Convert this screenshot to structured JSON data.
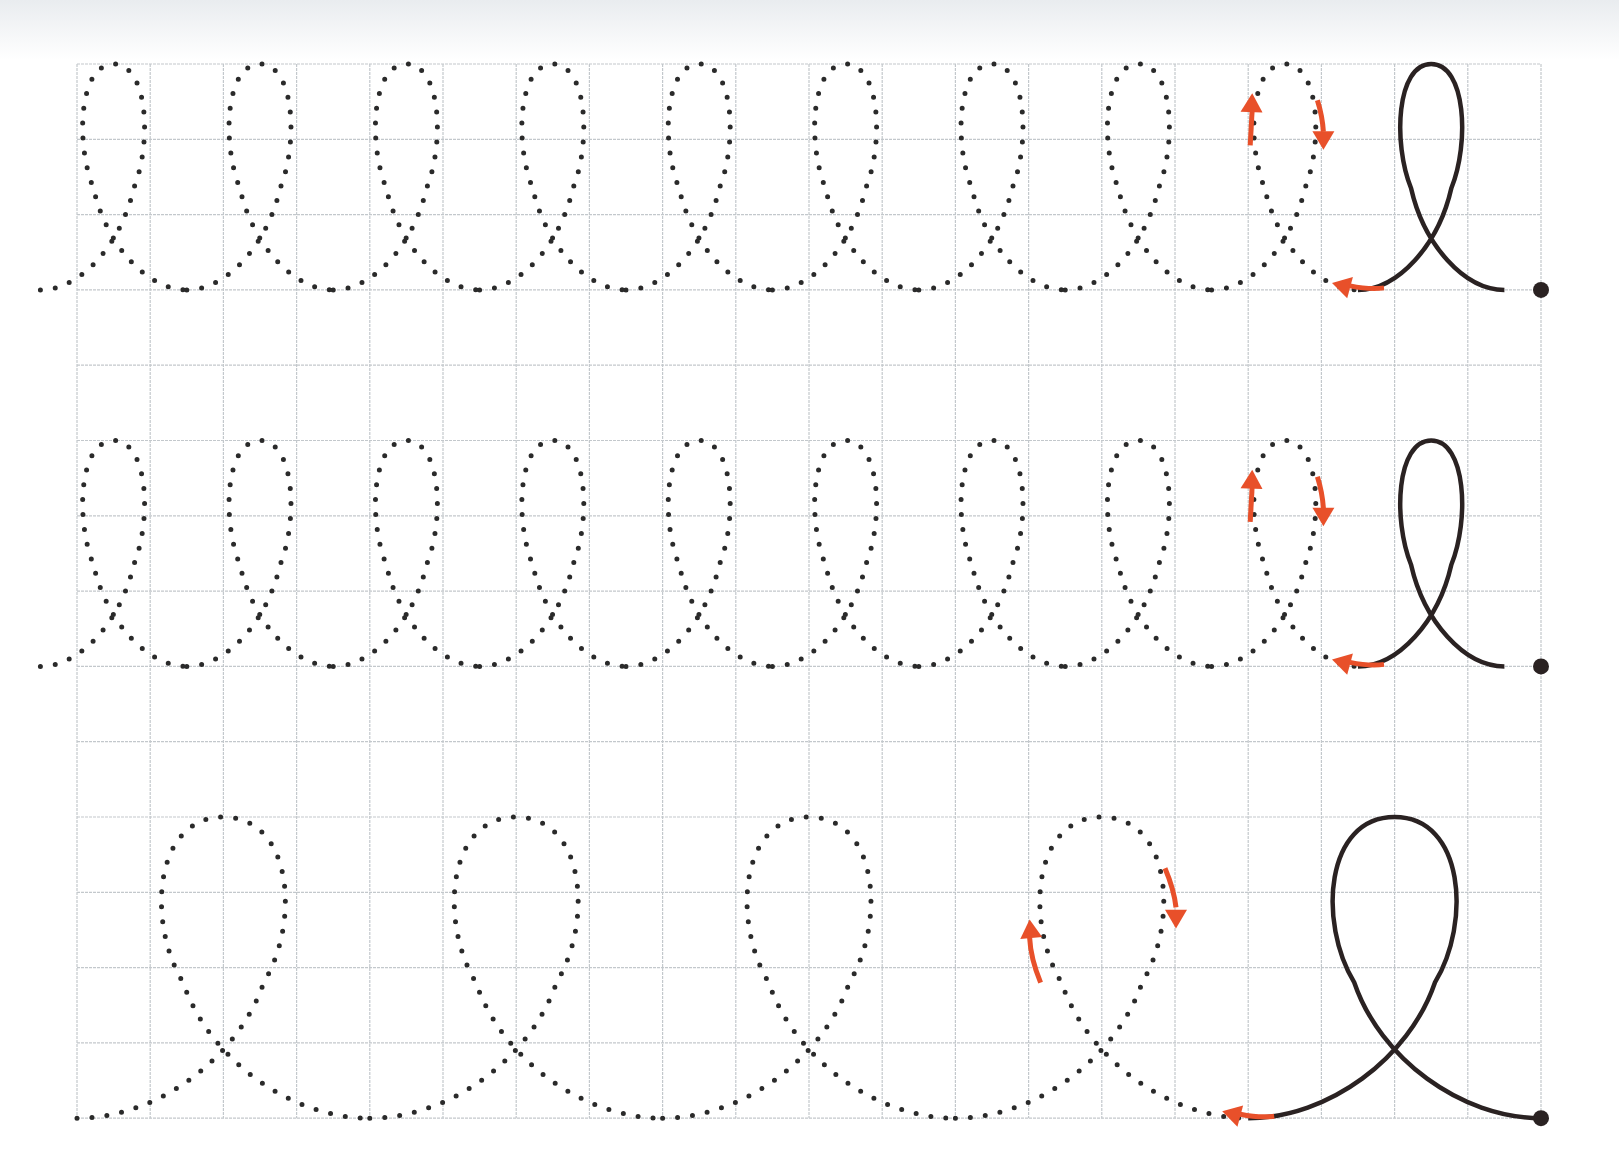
{
  "worksheet": {
    "title": "Loop tracing practice",
    "grid": {
      "left": 77,
      "top": 64,
      "col_width": 73.2,
      "row_height": 75.3,
      "cols": 20,
      "rows": 14,
      "line_color": "#c3c8cc"
    },
    "colors": {
      "ink": "#2a2222",
      "arrow": "#e8502a",
      "dot": "#2a2a2a"
    },
    "rows": [
      {
        "name": "row-1-small-loops",
        "top_line": 0,
        "height_rows": 3,
        "loop_width_cols": 1,
        "dotted_centers": [
          0.5,
          2.5,
          4.5,
          6.5,
          8.5,
          10.5,
          12.5,
          14.5,
          16.5
        ],
        "solid_center": 18.5,
        "end_col": 20,
        "start_col": 0
      },
      {
        "name": "row-2-small-loops",
        "top_line": 5,
        "height_rows": 3,
        "loop_width_cols": 1,
        "dotted_centers": [
          0.5,
          2.5,
          4.5,
          6.5,
          8.5,
          10.5,
          12.5,
          14.5,
          16.5
        ],
        "solid_center": 18.5,
        "end_col": 20,
        "start_col": 0
      },
      {
        "name": "row-3-large-loops",
        "top_line": 10,
        "height_rows": 4,
        "loop_width_cols": 2,
        "dotted_centers": [
          2,
          6,
          10,
          14
        ],
        "solid_center": 18,
        "end_col": 20,
        "start_col": 0
      }
    ]
  }
}
